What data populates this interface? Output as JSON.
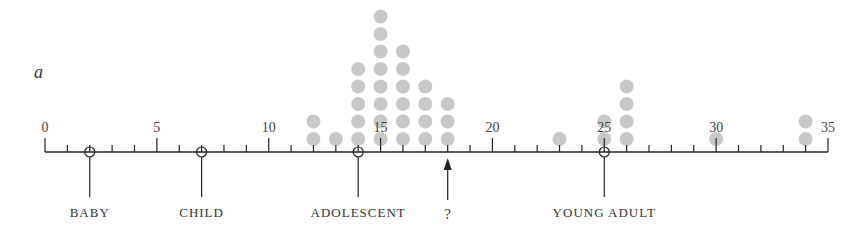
{
  "chart_data": {
    "type": "scatter",
    "subtype": "dot-plot",
    "panel_label": "a",
    "title": "",
    "xlabel": "",
    "ylabel": "",
    "xlim": [
      0,
      35
    ],
    "major_ticks": [
      0,
      5,
      10,
      15,
      20,
      25,
      30,
      35
    ],
    "minor_tick_step": 1,
    "grid": false,
    "dot_color": "#c8c8c8",
    "axis_color": "#222222",
    "dot_counts": [
      {
        "x": 12,
        "count": 2
      },
      {
        "x": 13,
        "count": 1
      },
      {
        "x": 14,
        "count": 5
      },
      {
        "x": 15,
        "count": 8
      },
      {
        "x": 16,
        "count": 6
      },
      {
        "x": 17,
        "count": 4
      },
      {
        "x": 18,
        "count": 3
      },
      {
        "x": 23,
        "count": 1
      },
      {
        "x": 25,
        "count": 2
      },
      {
        "x": 26,
        "count": 4
      },
      {
        "x": 30,
        "count": 1
      },
      {
        "x": 34,
        "count": 2
      }
    ],
    "markers": [
      {
        "x": 2,
        "label": "BABY",
        "style": "circle"
      },
      {
        "x": 7,
        "label": "CHILD",
        "style": "circle"
      },
      {
        "x": 14,
        "label": "ADOLESCENT",
        "style": "circle"
      },
      {
        "x": 18,
        "label": "?",
        "style": "arrow"
      },
      {
        "x": 25,
        "label": "YOUNG ADULT",
        "style": "circle"
      }
    ]
  }
}
